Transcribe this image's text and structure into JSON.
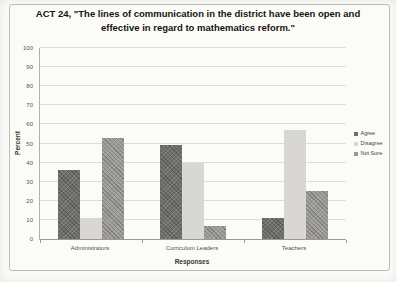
{
  "chart_data": {
    "type": "bar",
    "title": "ACT 24, \"The lines of communication in the district have been open and effective in regard to mathematics reform.\"",
    "xlabel": "Responses",
    "ylabel": "Percent",
    "categories": [
      "Administrators",
      "Curriculum Leaders",
      "Teachers"
    ],
    "series": [
      {
        "name": "Agree",
        "values": [
          36,
          49,
          11
        ],
        "color": "#6f6f6d",
        "pattern": "crosshatch"
      },
      {
        "name": "Disagree",
        "values": [
          11,
          40,
          57
        ],
        "color": "#d8d7d3",
        "pattern": "solid"
      },
      {
        "name": "Not Sure",
        "values": [
          53,
          7,
          25
        ],
        "color": "#9e9d99",
        "pattern": "crosshatch"
      }
    ],
    "ylim": [
      0,
      100
    ],
    "ytick_step": 10,
    "grid": true,
    "legend_position": "right"
  }
}
